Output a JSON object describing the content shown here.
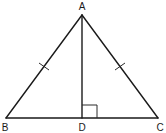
{
  "diagram": {
    "type": "geometry",
    "points": {
      "A": {
        "label": "A",
        "x": 82,
        "y": 15,
        "label_x": 82,
        "label_y": 10
      },
      "B": {
        "label": "B",
        "x": 6,
        "y": 118,
        "label_x": 5,
        "label_y": 131
      },
      "C": {
        "label": "C",
        "x": 158,
        "y": 118,
        "label_x": 160,
        "label_y": 131
      },
      "D": {
        "label": "D",
        "x": 82,
        "y": 118,
        "label_x": 82,
        "label_y": 131
      }
    },
    "segments": [
      {
        "from": "A",
        "to": "B"
      },
      {
        "from": "A",
        "to": "C"
      },
      {
        "from": "B",
        "to": "C"
      },
      {
        "from": "A",
        "to": "D"
      }
    ],
    "congruence_marks": [
      {
        "segment": "AB",
        "ticks": 1
      },
      {
        "segment": "AC",
        "ticks": 1
      }
    ],
    "right_angle": {
      "at": "D",
      "between": [
        "DA",
        "DC"
      ],
      "size": 15
    },
    "colors": {
      "stroke": "#1a1a1a",
      "background": "#ffffff"
    }
  }
}
